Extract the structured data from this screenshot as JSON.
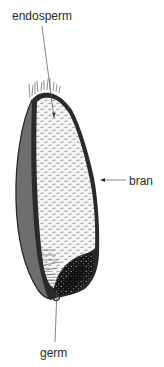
{
  "diagram": {
    "labels": {
      "endosperm": "endosperm",
      "bran": "bran",
      "germ": "germ"
    },
    "parts": [
      {
        "name": "endosperm",
        "description": "light speckled starchy interior",
        "color": "#f2f2f2"
      },
      {
        "name": "bran",
        "description": "dark outer coat",
        "color": "#6e6e6e"
      },
      {
        "name": "germ",
        "description": "black speckled embryo at base",
        "color": "#1a1a1a"
      }
    ],
    "colors": {
      "outline": "#2a2a2a",
      "bran_fill": "#6e6e6e",
      "endosperm_fill": "#f2f2f2",
      "germ_fill": "#1a1a1a",
      "leader_line": "#555555",
      "text": "#2a2a2a"
    }
  }
}
